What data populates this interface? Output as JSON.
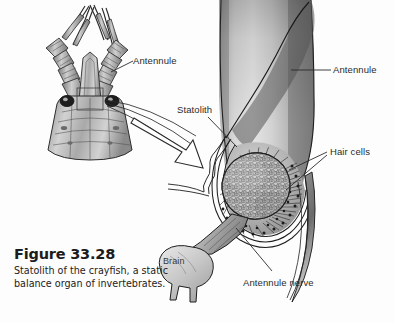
{
  "figure": {
    "number": "Figure 33.28",
    "caption": "Statolith of the crayfish, a static balance organ of invertebrates.",
    "background_color": "#fdfdfd",
    "label_color": "#2b2b2b",
    "ink_color": "#1a1a1a"
  },
  "labels": {
    "antennule_left": "Antennule",
    "antennule_right": "Antennule",
    "statolith": "Statolith",
    "hair_cells": "Hair cells",
    "antennule_nerve": "Antennule nerve",
    "brain": "Brain"
  },
  "panels": {
    "overview": {
      "name": "crayfish-head-dorsal-view",
      "description": "Dorsal view of crayfish head showing paired antennae and antennules"
    },
    "detail": {
      "name": "antennule-base-statocyst-cutaway",
      "description": "Enlarged cutaway of the antennule base showing the statocyst sac"
    }
  },
  "structures": [
    "antennule",
    "statolith",
    "hair cells",
    "antennule nerve",
    "brain"
  ],
  "colors": {
    "tissue_light": "#e3e3e3",
    "tissue_mid": "#b5b5b5",
    "tissue_dark": "#6e6e6e",
    "tissue_darkest": "#4a4a4a",
    "granule_fill": "#bcbcbc",
    "outline": "#1f1f1f"
  }
}
